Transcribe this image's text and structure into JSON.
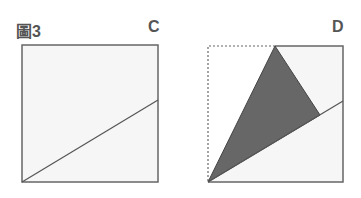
{
  "figure": {
    "title": "圖3",
    "panels": [
      {
        "label": "C"
      },
      {
        "label": "D"
      }
    ]
  },
  "colors": {
    "square_fill": "#f6f6f6",
    "square_stroke": "#666666",
    "triangle_fill": "#676767",
    "line": "#555555",
    "label": "#555555"
  }
}
